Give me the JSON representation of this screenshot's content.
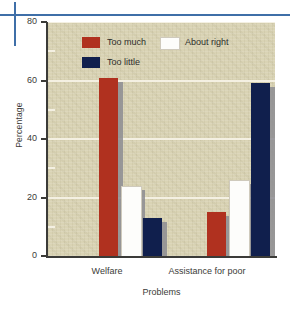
{
  "chart_data": {
    "type": "bar",
    "title": "",
    "xlabel": "Problems",
    "ylabel": "Percentage",
    "categories": [
      "Welfare",
      "Assistance for poor"
    ],
    "series": [
      {
        "name": "Too much",
        "color": "#b0311f",
        "values": [
          61,
          15
        ]
      },
      {
        "name": "About right",
        "color": "#fdfdfb",
        "values": [
          24,
          26
        ]
      },
      {
        "name": "Too little",
        "color": "#101f4d",
        "values": [
          13,
          59
        ]
      }
    ],
    "ylim": [
      0,
      80
    ],
    "yticks": [
      0,
      20,
      40,
      60,
      80
    ],
    "ytick_labels": [
      "0",
      "20",
      "40",
      "60",
      "80"
    ],
    "yminor_ticks": [
      10,
      30,
      50,
      70
    ],
    "grid": true,
    "legend_position": "upper-left-inside",
    "plot_background": "#d9d3b4",
    "gridline_color": "#f4f0e2",
    "axis_color": "#3b3b38",
    "decoration_rule_color": "#3f6fa8"
  },
  "axis": {
    "y_title": "Percentage",
    "x_title": "Problems",
    "y_tick_labels": [
      "80",
      "60",
      "40",
      "20",
      "0"
    ],
    "x_tick_labels": [
      "Welfare",
      "Assistance for poor"
    ]
  },
  "legend": {
    "items": [
      {
        "label": "Too much"
      },
      {
        "label": "Too little"
      },
      {
        "label": "About right"
      }
    ]
  }
}
